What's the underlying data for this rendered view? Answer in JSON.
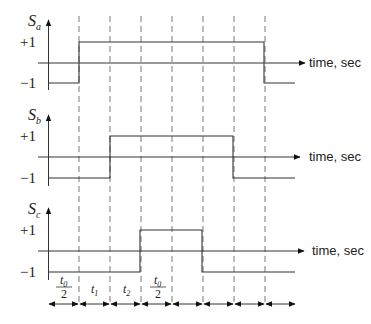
{
  "diagram": {
    "type": "timing-diagram",
    "x_axis_label": "time, sec",
    "level_labels": {
      "high": "+1",
      "low": "−1"
    },
    "dashed_line_count": 7,
    "signals": [
      {
        "name": "S",
        "subscript": "a",
        "waveform": [
          -1,
          1,
          1,
          1,
          1,
          1,
          1,
          1,
          -1
        ],
        "rise_boundary": 1,
        "fall_boundary": 7
      },
      {
        "name": "S",
        "subscript": "b",
        "waveform": [
          -1,
          -1,
          1,
          1,
          1,
          1,
          1,
          -1,
          -1
        ],
        "rise_boundary": 2,
        "fall_boundary": 6
      },
      {
        "name": "S",
        "subscript": "c",
        "waveform": [
          -1,
          -1,
          -1,
          1,
          1,
          -1,
          -1,
          -1,
          -1
        ],
        "rise_boundary": 3,
        "fall_boundary": 5
      }
    ],
    "interval_labels": [
      {
        "type": "fraction",
        "numerator_var": "t",
        "numerator_sub": "0",
        "denominator": "2"
      },
      {
        "type": "var",
        "var": "t",
        "sub": "1"
      },
      {
        "type": "var",
        "var": "t",
        "sub": "2"
      },
      {
        "type": "fraction",
        "numerator_var": "t",
        "numerator_sub": "0",
        "denominator": "2"
      },
      {
        "type": "none"
      },
      {
        "type": "none"
      },
      {
        "type": "none"
      },
      {
        "type": "none"
      }
    ],
    "interval_arrow_count": 8
  }
}
